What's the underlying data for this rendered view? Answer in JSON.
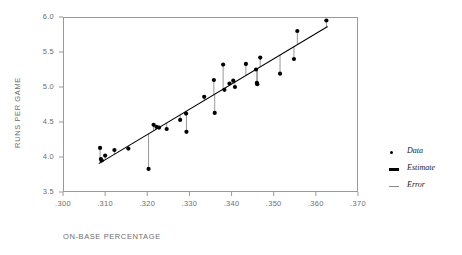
{
  "chart_data": {
    "type": "scatter",
    "title": "",
    "xlabel": "ON-BASE PERCENTAGE",
    "ylabel": "RUNS PER GAME",
    "xlim": [
      0.3,
      0.37
    ],
    "ylim": [
      3.5,
      6.0
    ],
    "grid": false,
    "legend_position": "right",
    "xticks": [
      ".300",
      ".310",
      ".320",
      ".330",
      ".340",
      ".350",
      ".360",
      ".370"
    ],
    "xtick_values": [
      0.3,
      0.31,
      0.32,
      0.33,
      0.34,
      0.35,
      0.36,
      0.37
    ],
    "yticks": [
      "3.5",
      "4.0",
      "4.5",
      "5.0",
      "5.5",
      "6.0"
    ],
    "ytick_values": [
      3.5,
      4.0,
      4.5,
      5.0,
      5.5,
      6.0
    ],
    "legend": [
      {
        "label": "Data",
        "marker": "dot",
        "color": "#000000"
      },
      {
        "label": "Estimate",
        "marker": "thick-line",
        "color": "#000000"
      },
      {
        "label": "Error",
        "marker": "thin-line",
        "color": "#8c8c8c"
      }
    ],
    "series": [
      {
        "name": "Data",
        "x": [
          0.3088,
          0.309,
          0.3092,
          0.31,
          0.3122,
          0.3155,
          0.3203,
          0.3215,
          0.3222,
          0.3228,
          0.3246,
          0.3278,
          0.3292,
          0.3293,
          0.3335,
          0.3358,
          0.336,
          0.338,
          0.3383,
          0.3395,
          0.3404,
          0.3408,
          0.3434,
          0.3458,
          0.346,
          0.3461,
          0.3468,
          0.3515,
          0.3548,
          0.3556,
          0.3625
        ],
        "y": [
          4.13,
          3.97,
          3.95,
          4.02,
          4.1,
          4.12,
          3.83,
          4.46,
          4.43,
          4.42,
          4.4,
          4.53,
          4.62,
          4.36,
          4.86,
          5.1,
          4.63,
          5.32,
          4.96,
          5.05,
          5.09,
          5.0,
          5.33,
          5.25,
          5.06,
          5.04,
          5.42,
          5.19,
          5.4,
          5.8,
          5.95
        ]
      },
      {
        "name": "Estimate",
        "description": "least-squares regression line",
        "x": [
          0.3085,
          0.3628
        ],
        "y": [
          3.905,
          5.865
        ]
      }
    ],
    "error_segments_note": "Vertical gray residual lines drawn from each data point to the regression line"
  },
  "axes": {
    "x_label": "ON-BASE PERCENTAGE",
    "y_label": "RUNS PER GAME"
  }
}
